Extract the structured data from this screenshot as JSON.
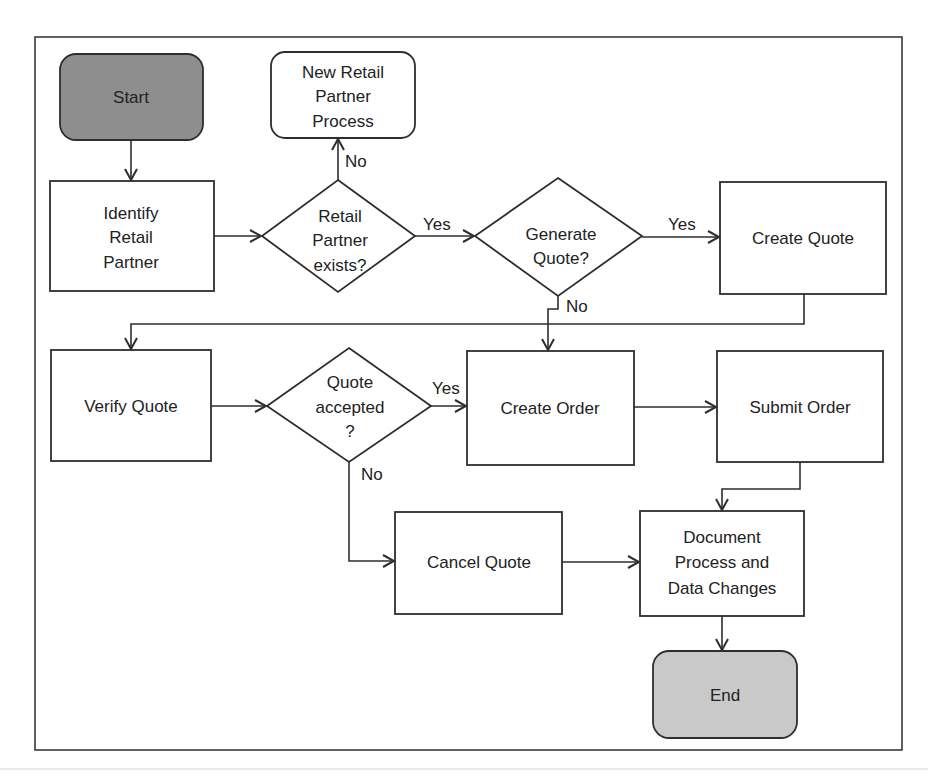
{
  "diagram": {
    "type": "flowchart",
    "colors": {
      "start_fill": "#8e8e8e",
      "end_fill": "#c9c9c9",
      "stroke": "#2e2e2e"
    },
    "nodes": {
      "start": {
        "shape": "terminator",
        "lines": [
          "Start"
        ]
      },
      "new_partner": {
        "shape": "terminator",
        "lines": [
          "New Retail",
          "Partner",
          "Process"
        ]
      },
      "identify": {
        "shape": "process",
        "lines": [
          "Identify",
          "Retail",
          "Partner"
        ]
      },
      "partner_exists": {
        "shape": "decision",
        "lines": [
          "Retail",
          "Partner",
          "exists?"
        ]
      },
      "generate_quote": {
        "shape": "decision",
        "lines": [
          "Generate",
          "Quote?"
        ]
      },
      "create_quote": {
        "shape": "process",
        "lines": [
          "Create Quote"
        ]
      },
      "verify_quote": {
        "shape": "process",
        "lines": [
          "Verify Quote"
        ]
      },
      "quote_accepted": {
        "shape": "decision",
        "lines": [
          "Quote",
          "accepted",
          "?"
        ]
      },
      "create_order": {
        "shape": "process",
        "lines": [
          "Create Order"
        ]
      },
      "submit_order": {
        "shape": "process",
        "lines": [
          "Submit Order"
        ]
      },
      "cancel_quote": {
        "shape": "process",
        "lines": [
          "Cancel Quote"
        ]
      },
      "document": {
        "shape": "process",
        "lines": [
          "Document",
          "Process and",
          "Data Changes"
        ]
      },
      "end": {
        "shape": "terminator",
        "lines": [
          "End"
        ]
      }
    },
    "edges": [
      {
        "from": "start",
        "to": "identify",
        "label": ""
      },
      {
        "from": "identify",
        "to": "partner_exists",
        "label": ""
      },
      {
        "from": "partner_exists",
        "to": "new_partner",
        "label": "No"
      },
      {
        "from": "partner_exists",
        "to": "generate_quote",
        "label": "Yes"
      },
      {
        "from": "generate_quote",
        "to": "create_quote",
        "label": "Yes"
      },
      {
        "from": "generate_quote",
        "to": "create_order",
        "label": "No"
      },
      {
        "from": "create_quote",
        "to": "verify_quote",
        "label": ""
      },
      {
        "from": "verify_quote",
        "to": "quote_accepted",
        "label": ""
      },
      {
        "from": "quote_accepted",
        "to": "create_order",
        "label": "Yes"
      },
      {
        "from": "quote_accepted",
        "to": "cancel_quote",
        "label": "No"
      },
      {
        "from": "create_order",
        "to": "submit_order",
        "label": ""
      },
      {
        "from": "submit_order",
        "to": "document",
        "label": ""
      },
      {
        "from": "cancel_quote",
        "to": "document",
        "label": ""
      },
      {
        "from": "document",
        "to": "end",
        "label": ""
      }
    ],
    "edge_labels": {
      "partner_exists_no": "No",
      "partner_exists_yes": "Yes",
      "generate_quote_yes": "Yes",
      "generate_quote_no": "No",
      "quote_accepted_yes": "Yes",
      "quote_accepted_no": "No"
    }
  }
}
